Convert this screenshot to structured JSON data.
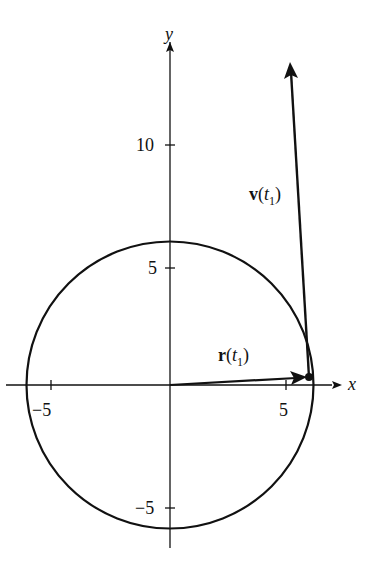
{
  "diagram": {
    "axes": {
      "x_label": "x",
      "y_label": "y",
      "x_ticks": [
        {
          "value": -5,
          "label": "−5"
        },
        {
          "value": 5,
          "label": "5"
        }
      ],
      "y_ticks": [
        {
          "value": 10,
          "label": "10"
        },
        {
          "value": 5,
          "label": "5"
        },
        {
          "value": -5,
          "label": "−5"
        }
      ]
    },
    "vectors": {
      "position": {
        "label_main": "r",
        "label_open": "(",
        "label_var": "t",
        "label_sub": "1",
        "label_close": ")"
      },
      "velocity": {
        "label_main": "v",
        "label_open": "(",
        "label_var": "t",
        "label_sub": "1",
        "label_close": ")"
      }
    },
    "colors": {
      "ink": "#111111",
      "background": "#ffffff"
    }
  }
}
